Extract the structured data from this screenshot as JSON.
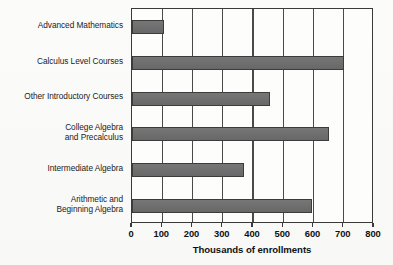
{
  "chart_data": {
    "type": "bar",
    "orientation": "horizontal",
    "title": "",
    "xlabel": "Thousands of enrollments",
    "ylabel": "",
    "xlim": [
      0,
      800
    ],
    "xticks": [
      0,
      100,
      200,
      300,
      400,
      500,
      600,
      700,
      800
    ],
    "grid": "vertical gridlines at each x tick",
    "legend": "none",
    "categories": [
      "Advanced Mathematics",
      "Calculus Level Courses",
      "Other Introductory Courses",
      "College Algebra\nand Precalculus",
      "Intermediate Algebra",
      "Arithmetic and\nBeginning Algebra"
    ],
    "values": [
      105,
      700,
      455,
      650,
      370,
      595
    ],
    "bar_color": "#6e6e6e",
    "bar_edge_color": "#3c3c3c",
    "axis_color": "#3a3a3a",
    "background_color": "#fbfbfa"
  }
}
